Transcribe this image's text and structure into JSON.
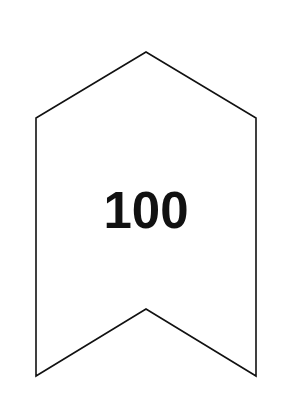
{
  "banner": {
    "label": "100",
    "stroke_color": "#111111",
    "fill_color": "#ffffff",
    "text_color": "#111111"
  }
}
